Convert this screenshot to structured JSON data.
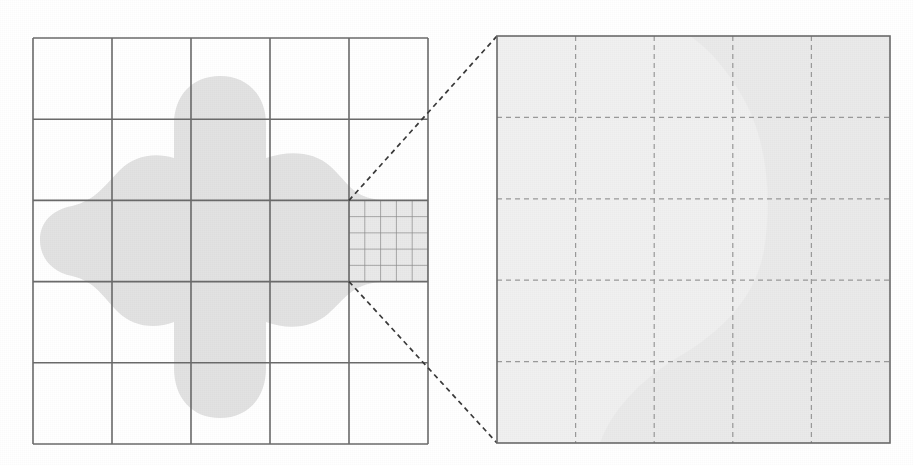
{
  "figure": {
    "background_color": "#ffffff"
  },
  "colors": {
    "grid_line": "#6b6b6b",
    "fine_grid_line": "#8d8d8d",
    "dashed_connector": "#3a3a3a",
    "panel_border": "#6b6b6b",
    "blob_fill": "#e2e2e2",
    "right_panel_fill": "#f0f0f0",
    "right_panel_dashed": "#9a9a9a",
    "right_panel_ghost": "#e7e7e7"
  },
  "left_panel": {
    "name": "coarse-grid-panel",
    "x": 33,
    "y": 38,
    "width": 395,
    "height": 406,
    "columns": 5,
    "rows": 5,
    "cell_width": 79.0,
    "cell_height": 81.2,
    "vertical_line_x": [
      33,
      112,
      191,
      270,
      349,
      428
    ],
    "horizontal_line_y": [
      38,
      119.2,
      200.4,
      281.6,
      362.8,
      444
    ],
    "stroke_width": 1.6
  },
  "refined_cell": {
    "name": "refined-cell",
    "column_index": 4,
    "row_index": 2,
    "x": 349,
    "y": 200.4,
    "width": 79,
    "height": 81.2,
    "subdivisions_x": 5,
    "subdivisions_y": 5,
    "sub_cell_width": 15.8,
    "sub_cell_height": 16.24,
    "stroke_width": 0.7
  },
  "right_panel": {
    "name": "magnified-cell-panel",
    "x": 497,
    "y": 36,
    "width": 393,
    "height": 407,
    "columns": 5,
    "rows": 5,
    "cell_width": 78.6,
    "cell_height": 81.4,
    "vertical_line_x": [
      497,
      575.6,
      654.2,
      732.8,
      811.4,
      890
    ],
    "horizontal_line_y": [
      36,
      117.4,
      198.8,
      280.2,
      361.6,
      443
    ],
    "dash_pattern": "5,4",
    "stroke_width": 1.2,
    "border_stroke_width": 1.6
  },
  "connectors": [
    {
      "name": "magnifier-connector-top",
      "from_x": 349,
      "from_y": 200.4,
      "to_x": 497,
      "to_y": 36,
      "dash_pattern": "5,4",
      "stroke_width": 1.7
    },
    {
      "name": "magnifier-connector-bottom",
      "from_x": 349,
      "from_y": 281.6,
      "to_x": 497,
      "to_y": 443,
      "dash_pattern": "5,4",
      "stroke_width": 1.7
    }
  ],
  "blob": {
    "name": "domain-blob",
    "description": "Organic four-lobed cross-shaped region occupying the centre of the coarse grid",
    "fill": "#e2e2e2",
    "path": "M 220 76 C 248 76 266 96 266 124 L 266 158 C 290 150 314 152 330 166 C 348 182 352 198 382 200 L 428 200 L 428 282 L 380 282 C 352 284 344 300 328 314 C 312 328 288 330 266 322 L 266 368 C 266 398 248 418 220 418 C 192 418 174 398 174 368 L 174 322 C 154 330 132 326 118 312 C 102 296 96 282 72 276 C 52 272 40 258 40 240 C 40 222 52 210 72 206 C 96 200 104 186 120 170 C 134 156 154 152 174 158 L 174 124 C 174 96 192 76 220 76 Z"
  },
  "right_ghost_shape": {
    "name": "magnified-blob-edge",
    "description": "Faint blob boundary visible inside the magnified cell",
    "fill": "#e8e8e8",
    "path": "M 890 36 L 890 443 L 600 443 C 612 410 640 380 680 356 C 724 330 756 296 764 250 C 772 200 768 140 742 96 C 726 68 708 48 690 36 Z"
  }
}
